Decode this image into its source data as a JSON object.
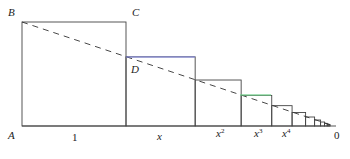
{
  "diagram": {
    "points": {
      "A": "A",
      "B": "B",
      "C": "C",
      "D": "D",
      "zero": "0"
    },
    "axis_labels": [
      {
        "text": "1",
        "sup": ""
      },
      {
        "text": "x",
        "sup": ""
      },
      {
        "text": "x",
        "sup": "2"
      },
      {
        "text": "x",
        "sup": "3"
      },
      {
        "text": "x",
        "sup": "4"
      }
    ],
    "ratio": 0.665,
    "colors": {
      "square_stroke": "#444444",
      "dashed_line": "#333333",
      "highlight_blue": "#7f84e6",
      "highlight_green": "#6fd28a"
    }
  }
}
